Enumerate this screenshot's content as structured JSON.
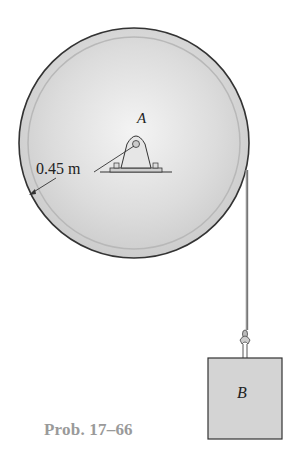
{
  "figure": {
    "point_label": "A",
    "radius_label": "0.45 m",
    "block_label": "B",
    "caption": "Prob. 17–66"
  },
  "colors": {
    "disk_fill": "#d9d9d9",
    "disk_rim": "#bdbdbd",
    "outline": "#333333",
    "caption": "#9a9a9a",
    "block_fill": "#d4d4d4"
  }
}
